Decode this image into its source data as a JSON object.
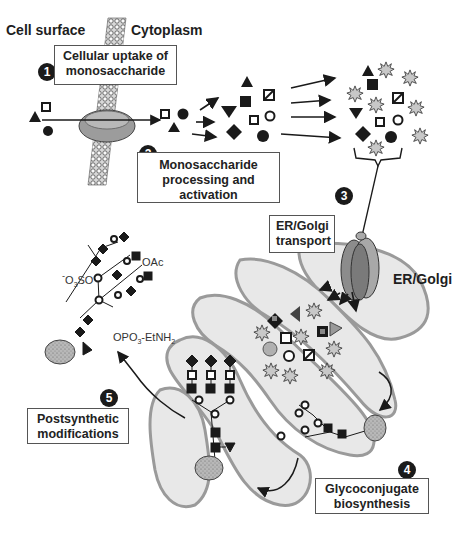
{
  "labels": {
    "cell_surface": "Cell surface",
    "cytoplasm": "Cytoplasm",
    "er_golgi": "ER/Golgi"
  },
  "steps": [
    {
      "number": "1",
      "line1": "Cellular uptake of",
      "line2": "monosaccharide"
    },
    {
      "number": "2",
      "line1": "Monosaccharide",
      "line2": "processing and",
      "line3": "activation"
    },
    {
      "number": "3",
      "line1": "ER/Golgi",
      "line2": "transport"
    },
    {
      "number": "4",
      "line1": "Glycoconjugate",
      "line2": "biosynthesis"
    },
    {
      "number": "5",
      "line1": "Postsynthetic",
      "line2": "modifications"
    }
  ],
  "modifications": {
    "acetyl": "OAc",
    "sulfate_prefix": "O",
    "sulfate_sub": "3",
    "sulfate_suffix": "SO",
    "sulfate_charge": "-",
    "phospho_prefix": "OPO",
    "phospho_sub": "3",
    "phospho_mid": "-EtNH",
    "phospho_sub2": "2"
  },
  "symbols": {
    "monosaccharides": [
      "triangle",
      "open-square",
      "circle",
      "inverted-triangle",
      "filled-square",
      "hatched-square",
      "open-circle",
      "diamond"
    ],
    "activated_group": "starburst (nucleotide)",
    "protein_anchor": "stippled-oval"
  },
  "colors": {
    "ink": "#1a1a1a",
    "organelle_fill": "#e8e8e8",
    "organelle_outline": "#9a9a9a",
    "protein_fill": "#9a9a9a",
    "transporter_fill": "#8c8c8c",
    "starburst_fill": "#c8c8c8"
  },
  "caption": "(faded, illegible caption line)"
}
